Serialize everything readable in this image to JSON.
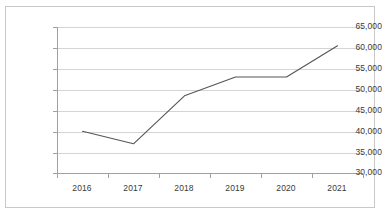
{
  "chart_data": {
    "type": "line",
    "title": "",
    "subtitle": "",
    "xlabel": "",
    "ylabel": "",
    "categories": [
      "2016",
      "2017",
      "2018",
      "2019",
      "2020",
      "2021"
    ],
    "x": [
      2016,
      2017,
      2018,
      2019,
      2020,
      2021
    ],
    "series": [
      {
        "name": "",
        "values": [
          40000,
          37000,
          48500,
          53000,
          53000,
          60500
        ]
      }
    ],
    "values": [
      40000,
      37000,
      48500,
      53000,
      53000,
      60500
    ],
    "ylim": [
      30000,
      65000
    ],
    "ytick_step": 5000,
    "ytick_labels": [
      "65,000",
      "60,000",
      "55,000",
      "50,000",
      "45,000",
      "40,000",
      "35,000",
      "30,000"
    ],
    "ytick_values": [
      65000,
      60000,
      55000,
      50000,
      45000,
      40000,
      35000,
      30000
    ],
    "xtick_labels": [
      "2016",
      "2017",
      "2018",
      "2019",
      "2020",
      "2021"
    ],
    "grid": "horizontal",
    "legend": "none",
    "annotations": [],
    "colors": {
      "line": "#555555",
      "gridline": "#d4d4d4",
      "axis": "#a0a0a0",
      "border": "#c8c8c8",
      "tick_text": "#3a3a3a",
      "background": "#ffffff"
    }
  }
}
